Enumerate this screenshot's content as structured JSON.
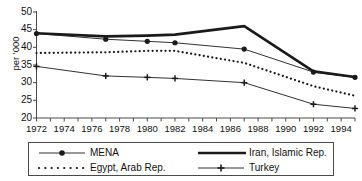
{
  "chart_data": {
    "type": "line",
    "title": "",
    "subtitle": "",
    "xlabel": "",
    "ylabel": "per '000",
    "xlim": [
      1972,
      1995
    ],
    "ylim": [
      20,
      50
    ],
    "yticks": [
      20,
      25,
      30,
      35,
      40,
      45,
      50
    ],
    "xticks": [
      1972,
      1973,
      1974,
      1975,
      1976,
      1977,
      1978,
      1979,
      1980,
      1981,
      1982,
      1983,
      1984,
      1985,
      1986,
      1987,
      1988,
      1989,
      1990,
      1991,
      1992,
      1993,
      1994,
      1995
    ],
    "xtick_labels": [
      "1972",
      "1974",
      "1976",
      "1978",
      "1980",
      "1982",
      "1984",
      "1986",
      "1988",
      "1990",
      "1992",
      "1994"
    ],
    "xtick_label_years": [
      1972,
      1974,
      1976,
      1978,
      1980,
      1982,
      1984,
      1986,
      1988,
      1990,
      1992,
      1994
    ],
    "grid": false,
    "legend_position": "bottom",
    "series": [
      {
        "name": "MENA",
        "style": "thin-solid-circle",
        "color": "#1a1a1a",
        "marker": "circle",
        "x": [
          1972,
          1977,
          1980,
          1982,
          1987,
          1992,
          1995
        ],
        "values": [
          43.9,
          42.3,
          41.7,
          41.3,
          39.5,
          33.0,
          31.5
        ]
      },
      {
        "name": "Iran, Islamic Rep.",
        "style": "thick-solid",
        "color": "#1a1a1a",
        "marker": "none",
        "x": [
          1972,
          1977,
          1980,
          1982,
          1987,
          1992,
          1995
        ],
        "values": [
          44.0,
          43.1,
          43.3,
          43.6,
          46.0,
          33.2,
          31.6
        ]
      },
      {
        "name": "Egypt, Arab Rep.",
        "style": "dotted",
        "color": "#1a1a1a",
        "marker": "none",
        "x": [
          1972,
          1977,
          1980,
          1982,
          1987,
          1992,
          1995
        ],
        "values": [
          38.4,
          38.6,
          39.0,
          39.0,
          35.6,
          29.0,
          26.3
        ]
      },
      {
        "name": "Turkey",
        "style": "thin-solid-plus",
        "color": "#1a1a1a",
        "marker": "plus",
        "x": [
          1972,
          1977,
          1980,
          1982,
          1987,
          1992,
          1995
        ],
        "values": [
          34.6,
          31.9,
          31.5,
          31.2,
          30.0,
          23.9,
          22.7
        ]
      }
    ]
  },
  "axis": {
    "y_label": "per '000",
    "y_tick_labels": [
      "50",
      "45",
      "40",
      "35",
      "30",
      "25",
      "20"
    ],
    "x_tick_labels": [
      "1972",
      "1974",
      "1976",
      "1978",
      "1980",
      "1982",
      "1984",
      "1986",
      "1988",
      "1990",
      "1992",
      "1994"
    ]
  },
  "legend": {
    "entries": [
      {
        "label": "MENA",
        "sample": "line-with-circle-marker"
      },
      {
        "label": "Iran, Islamic Rep.",
        "sample": "thick-line"
      },
      {
        "label": "Egypt, Arab Rep.",
        "sample": "dotted-line"
      },
      {
        "label": "Turkey",
        "sample": "line-with-plus-marker"
      }
    ]
  },
  "colors": {
    "ink": "#1a1a1a",
    "axis": "#4a4a4a",
    "background": "#ffffff"
  }
}
